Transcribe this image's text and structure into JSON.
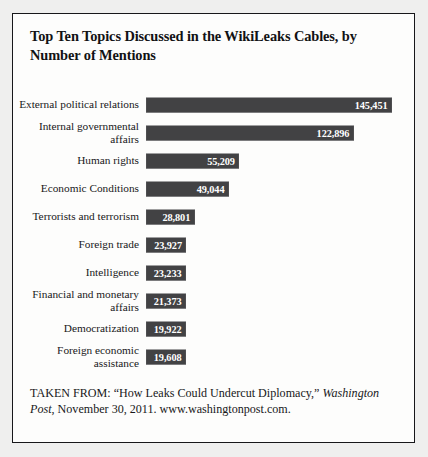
{
  "chart_data": {
    "type": "bar",
    "orientation": "horizontal",
    "title": "Top Ten Topics Discussed in the WikiLeaks Cables, by Number of Mentions",
    "xlabel": "",
    "ylabel": "",
    "grid": false,
    "legend": null,
    "xlim": [
      0,
      145451
    ],
    "categories": [
      "External political relations",
      "Internal governmental affairs",
      "Human rights",
      "Economic Conditions",
      "Terrorists and terrorism",
      "Foreign trade",
      "Intelligence",
      "Financial and monetary affairs",
      "Democratization",
      "Foreign economic assistance"
    ],
    "values": [
      145451,
      122896,
      55209,
      49044,
      28801,
      23927,
      23233,
      21373,
      19922,
      19608
    ],
    "value_labels": [
      "145,451",
      "122,896",
      "55,209",
      "49,044",
      "28,801",
      "23,927",
      "23,233",
      "21,373",
      "19,922",
      "19,608"
    ],
    "bar_color": "#424244",
    "value_label_color": "#ffffff"
  },
  "source": {
    "prefix": "TAKEN FROM: “How Leaks Could Undercut Diplomacy,” ",
    "publication": "Washington Post",
    "suffix": ", November 30, 2011. www.washingtonpost.com."
  }
}
